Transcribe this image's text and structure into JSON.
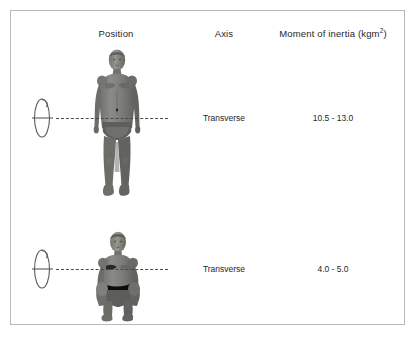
{
  "table": {
    "headers": {
      "position": "Position",
      "axis": "Axis",
      "inertia": "Moment of inertia (kgm",
      "inertia_exponent": "2",
      "inertia_close": ")"
    },
    "rows": [
      {
        "figure_name": "standing-body-figure",
        "position_description": "Standing extended body position, arms at sides",
        "rotation_symbol": "rotation-axis-ellipse-icon",
        "axis": "Transverse",
        "inertia": "10.5 - 13.0"
      },
      {
        "figure_name": "tucked-body-figure",
        "position_description": "Tucked body position, knees drawn to chest",
        "rotation_symbol": "rotation-axis-ellipse-icon",
        "axis": "Transverse",
        "inertia": "4.0 - 5.0"
      }
    ]
  },
  "colors": {
    "panel_border": "#b9b9b9",
    "background": "#ffffff",
    "text": "#26262a",
    "axis_dash": "#4a4a4a",
    "figure_mid_gray": "#7a7a78",
    "figure_dark_gray": "#5d5d5b",
    "figure_light_gray": "#9d9d9a",
    "symbol_stroke": "#5a5a5a"
  }
}
